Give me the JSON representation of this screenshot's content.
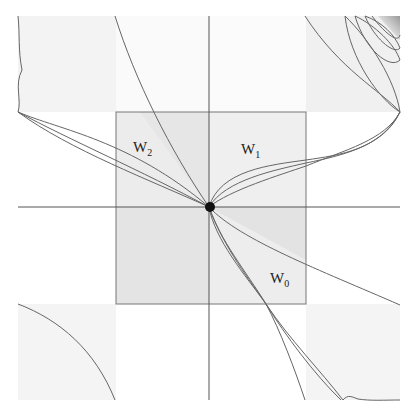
{
  "figure": {
    "labels": {
      "w0": {
        "main": "W",
        "sub": "0"
      },
      "w1": {
        "main": "W",
        "sub": "1"
      },
      "w2": {
        "main": "W",
        "sub": "2"
      }
    },
    "fixed_point": "origin",
    "colors": {
      "background": "#ffffff",
      "outer_shade": "#f4f4f4",
      "inner_shade_light": "#ececec",
      "inner_shade_dark": "#e2e2e2",
      "curve": "#666666",
      "axis": "#555555",
      "point": "#111111"
    }
  }
}
